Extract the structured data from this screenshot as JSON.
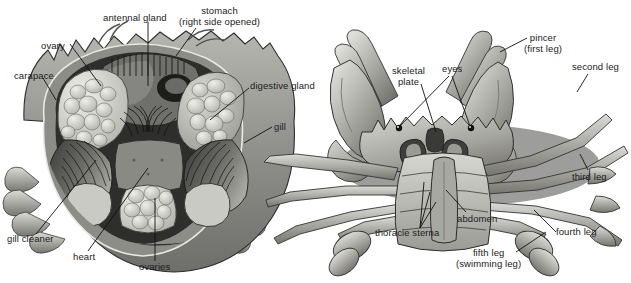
{
  "figure": {
    "background_color": "#ffffff",
    "ink_color": "#1b1b1b",
    "palette": {
      "shell_light": "#c9c9c5",
      "shell_mid": "#9a9a96",
      "shell_dark": "#6e6e6b",
      "shell_darker": "#4a4a48",
      "cavity_dark": "#2a2a29",
      "tissue_light": "#d8d8d4",
      "tissue_pale": "#e6e6e2",
      "outline": "#1b1b1b",
      "shadow": "#3b3b3a"
    }
  },
  "panels": [
    {
      "id": "dorsal-dissection",
      "name": "Dorsal dissected crab (carapace removed)",
      "labels": [
        {
          "id": "antennal-gland",
          "lines": [
            "antennal gland"
          ],
          "x": 103,
          "y": 13,
          "align": "left"
        },
        {
          "id": "stomach",
          "lines": [
            "stomach",
            "(right side opened)"
          ],
          "x": 179,
          "y": 6,
          "align": "center"
        },
        {
          "id": "ovary",
          "lines": [
            "ovary"
          ],
          "x": 41,
          "y": 41,
          "align": "left"
        },
        {
          "id": "carapace",
          "lines": [
            "carapace"
          ],
          "x": 14,
          "y": 71,
          "align": "left"
        },
        {
          "id": "digestive-gland",
          "lines": [
            "digestive gland"
          ],
          "x": 250,
          "y": 81,
          "align": "left"
        },
        {
          "id": "gill",
          "lines": [
            "gill"
          ],
          "x": 274,
          "y": 122,
          "align": "left"
        },
        {
          "id": "gill-cleaner",
          "lines": [
            "gill cleaner"
          ],
          "x": 7,
          "y": 234,
          "align": "left"
        },
        {
          "id": "heart",
          "lines": [
            "heart"
          ],
          "x": 73,
          "y": 252,
          "align": "left"
        },
        {
          "id": "ovaries",
          "lines": [
            "ovaries"
          ],
          "x": 139,
          "y": 262,
          "align": "left"
        }
      ]
    },
    {
      "id": "ventral-view",
      "name": "Ventral view of whole crab",
      "labels": [
        {
          "id": "pincer",
          "lines": [
            "pincer",
            "(first leg)"
          ],
          "x": 524,
          "y": 33,
          "align": "center"
        },
        {
          "id": "second-leg",
          "lines": [
            "second leg"
          ],
          "x": 572,
          "y": 62,
          "align": "left"
        },
        {
          "id": "skeletal-plate",
          "lines": [
            "skeletal",
            "plate"
          ],
          "x": 392,
          "y": 66,
          "align": "center"
        },
        {
          "id": "eyes",
          "lines": [
            "eyes"
          ],
          "x": 442,
          "y": 64,
          "align": "left"
        },
        {
          "id": "third-leg",
          "lines": [
            "third leg"
          ],
          "x": 572,
          "y": 172,
          "align": "left"
        },
        {
          "id": "abdomen",
          "lines": [
            "abdomen"
          ],
          "x": 457,
          "y": 214,
          "align": "left"
        },
        {
          "id": "thoracic-sterna",
          "lines": [
            "thoracie sterna"
          ],
          "x": 375,
          "y": 228,
          "align": "left"
        },
        {
          "id": "fourth-leg",
          "lines": [
            "fourth leg"
          ],
          "x": 556,
          "y": 227,
          "align": "left"
        },
        {
          "id": "fifth-leg",
          "lines": [
            "fifth leg",
            "(swimming leg)"
          ],
          "x": 456,
          "y": 248,
          "align": "center"
        }
      ]
    }
  ]
}
